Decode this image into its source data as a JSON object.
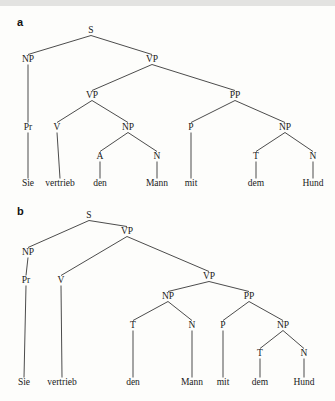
{
  "figure": {
    "background_color": "#fdfdfb",
    "ink_color": "#1a1a1a",
    "sentence": "Sie vertrieb den Mann mit dem Hund"
  },
  "panels": [
    {
      "letter": "a",
      "nodes": [
        {
          "id": "a-S",
          "label": "S",
          "x": 91,
          "y": 33
        },
        {
          "id": "a-NP1",
          "label": "NP",
          "x": 28,
          "y": 62
        },
        {
          "id": "a-VP1",
          "label": "VP",
          "x": 152,
          "y": 62
        },
        {
          "id": "a-VP2",
          "label": "VP",
          "x": 92,
          "y": 98
        },
        {
          "id": "a-PP",
          "label": "PP",
          "x": 235,
          "y": 98
        },
        {
          "id": "a-Pr",
          "label": "Pr",
          "x": 28,
          "y": 130
        },
        {
          "id": "a-V",
          "label": "V",
          "x": 57,
          "y": 130
        },
        {
          "id": "a-NP2",
          "label": "NP",
          "x": 128,
          "y": 130
        },
        {
          "id": "a-P",
          "label": "P",
          "x": 191,
          "y": 130
        },
        {
          "id": "a-NP3",
          "label": "NP",
          "x": 285,
          "y": 130
        },
        {
          "id": "a-A",
          "label": "A",
          "x": 100,
          "y": 159
        },
        {
          "id": "a-N1",
          "label": "N",
          "x": 157,
          "y": 159
        },
        {
          "id": "a-T",
          "label": "T",
          "x": 256,
          "y": 159
        },
        {
          "id": "a-N2",
          "label": "N",
          "x": 313,
          "y": 159
        }
      ],
      "leaves": [
        {
          "id": "a-w1",
          "label": "Sie",
          "x": 28,
          "y": 186
        },
        {
          "id": "a-w2",
          "label": "vertrieb",
          "x": 60,
          "y": 186
        },
        {
          "id": "a-w3",
          "label": "den",
          "x": 100,
          "y": 186
        },
        {
          "id": "a-w4",
          "label": "Mann",
          "x": 157,
          "y": 186
        },
        {
          "id": "a-w5",
          "label": "mit",
          "x": 191,
          "y": 186
        },
        {
          "id": "a-w6",
          "label": "dem",
          "x": 256,
          "y": 186
        },
        {
          "id": "a-w7",
          "label": "Hund",
          "x": 313,
          "y": 186
        }
      ],
      "edges": [
        {
          "from": "a-S",
          "to": "a-NP1"
        },
        {
          "from": "a-S",
          "to": "a-VP1"
        },
        {
          "from": "a-VP1",
          "to": "a-VP2"
        },
        {
          "from": "a-VP1",
          "to": "a-PP"
        },
        {
          "from": "a-NP1",
          "to": "a-Pr"
        },
        {
          "from": "a-VP2",
          "to": "a-V"
        },
        {
          "from": "a-VP2",
          "to": "a-NP2"
        },
        {
          "from": "a-PP",
          "to": "a-P"
        },
        {
          "from": "a-PP",
          "to": "a-NP3"
        },
        {
          "from": "a-NP2",
          "to": "a-A"
        },
        {
          "from": "a-NP2",
          "to": "a-N1"
        },
        {
          "from": "a-NP3",
          "to": "a-T"
        },
        {
          "from": "a-NP3",
          "to": "a-N2"
        },
        {
          "from": "a-Pr",
          "to": "a-w1"
        },
        {
          "from": "a-V",
          "to": "a-w2"
        },
        {
          "from": "a-A",
          "to": "a-w3"
        },
        {
          "from": "a-N1",
          "to": "a-w4"
        },
        {
          "from": "a-P",
          "to": "a-w5"
        },
        {
          "from": "a-T",
          "to": "a-w6"
        },
        {
          "from": "a-N2",
          "to": "a-w7"
        }
      ]
    },
    {
      "letter": "b",
      "nodes": [
        {
          "id": "b-S",
          "label": "S",
          "x": 89,
          "y": 20
        },
        {
          "id": "b-NP1",
          "label": "NP",
          "x": 28,
          "y": 57
        },
        {
          "id": "b-VP1",
          "label": "VP",
          "x": 127,
          "y": 36
        },
        {
          "id": "b-Pr",
          "label": "Pr",
          "x": 26,
          "y": 85
        },
        {
          "id": "b-V",
          "label": "V",
          "x": 61,
          "y": 85
        },
        {
          "id": "b-VP2",
          "label": "VP",
          "x": 209,
          "y": 81
        },
        {
          "id": "b-NP2",
          "label": "NP",
          "x": 168,
          "y": 101
        },
        {
          "id": "b-PP",
          "label": "PP",
          "x": 249,
          "y": 101
        },
        {
          "id": "b-T1",
          "label": "T",
          "x": 133,
          "y": 130
        },
        {
          "id": "b-N1",
          "label": "N",
          "x": 192,
          "y": 130
        },
        {
          "id": "b-P",
          "label": "P",
          "x": 223,
          "y": 130
        },
        {
          "id": "b-NP3",
          "label": "NP",
          "x": 283,
          "y": 130
        },
        {
          "id": "b-T2",
          "label": "T",
          "x": 260,
          "y": 158
        },
        {
          "id": "b-N2",
          "label": "N",
          "x": 304,
          "y": 158
        }
      ],
      "leaves": [
        {
          "id": "b-w1",
          "label": "Sie",
          "x": 24,
          "y": 187
        },
        {
          "id": "b-w2",
          "label": "vertrieb",
          "x": 62,
          "y": 187
        },
        {
          "id": "b-w3",
          "label": "den",
          "x": 133,
          "y": 187
        },
        {
          "id": "b-w4",
          "label": "Mann",
          "x": 192,
          "y": 187
        },
        {
          "id": "b-w5",
          "label": "mit",
          "x": 223,
          "y": 187
        },
        {
          "id": "b-w6",
          "label": "dem",
          "x": 260,
          "y": 187
        },
        {
          "id": "b-w7",
          "label": "Hund",
          "x": 304,
          "y": 187
        }
      ],
      "edges": [
        {
          "from": "b-S",
          "to": "b-NP1"
        },
        {
          "from": "b-S",
          "to": "b-VP1"
        },
        {
          "from": "b-NP1",
          "to": "b-Pr"
        },
        {
          "from": "b-VP1",
          "to": "b-V"
        },
        {
          "from": "b-VP1",
          "to": "b-VP2"
        },
        {
          "from": "b-VP2",
          "to": "b-NP2"
        },
        {
          "from": "b-VP2",
          "to": "b-PP"
        },
        {
          "from": "b-NP2",
          "to": "b-T1"
        },
        {
          "from": "b-NP2",
          "to": "b-N1"
        },
        {
          "from": "b-PP",
          "to": "b-P"
        },
        {
          "from": "b-PP",
          "to": "b-NP3"
        },
        {
          "from": "b-NP3",
          "to": "b-T2"
        },
        {
          "from": "b-NP3",
          "to": "b-N2"
        },
        {
          "from": "b-Pr",
          "to": "b-w1"
        },
        {
          "from": "b-V",
          "to": "b-w2"
        },
        {
          "from": "b-T1",
          "to": "b-w3"
        },
        {
          "from": "b-N1",
          "to": "b-w4"
        },
        {
          "from": "b-P",
          "to": "b-w5"
        },
        {
          "from": "b-T2",
          "to": "b-w6"
        },
        {
          "from": "b-N2",
          "to": "b-w7"
        }
      ]
    }
  ]
}
